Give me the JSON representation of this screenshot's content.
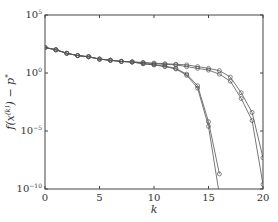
{
  "chart_data": {
    "type": "line",
    "title": "",
    "xlabel": "k",
    "ylabel": "f(x^(k)) − p*",
    "yscale": "log",
    "xlim": [
      0,
      20
    ],
    "ylim_log10": [
      -10,
      5
    ],
    "x_ticks": [
      0,
      5,
      10,
      15,
      20
    ],
    "x_tick_labels": [
      "0",
      "5",
      "10",
      "15",
      "20"
    ],
    "y_ticks_log10": [
      5,
      0,
      -5,
      -10
    ],
    "y_tick_labels": [
      "10^5",
      "10^0",
      "10^-5",
      "10^-10"
    ],
    "grid": false,
    "legend": null,
    "marker": "open circle",
    "line_color": "#555555",
    "series": [
      {
        "name": "series-1",
        "x": [
          0,
          1,
          2,
          3,
          4,
          5,
          6,
          7,
          8,
          9,
          10,
          11,
          12,
          13,
          14,
          15,
          16,
          17,
          18,
          19,
          20
        ],
        "log10_values": [
          2.2,
          2.0,
          1.7,
          1.5,
          1.4,
          1.2,
          1.1,
          1.0,
          0.95,
          0.9,
          0.85,
          0.8,
          0.75,
          0.7,
          0.55,
          0.4,
          0.2,
          -0.35,
          -1.7,
          -3.4,
          -7.3
        ]
      },
      {
        "name": "series-2",
        "x": [
          0,
          1,
          2,
          3,
          4,
          5,
          6,
          7,
          8,
          9,
          10,
          11,
          12,
          13,
          14,
          15,
          16,
          17,
          18,
          19,
          20
        ],
        "log10_values": [
          2.2,
          2.0,
          1.7,
          1.5,
          1.4,
          1.2,
          1.1,
          1.0,
          0.95,
          0.9,
          0.8,
          0.75,
          0.7,
          0.55,
          0.4,
          0.25,
          -0.1,
          -0.7,
          -2.2,
          -4.1,
          -9.6
        ]
      },
      {
        "name": "series-3",
        "x": [
          0,
          1,
          2,
          3,
          4,
          5,
          6,
          7,
          8,
          9,
          10,
          11,
          12,
          13,
          14,
          15,
          16
        ],
        "log10_values": [
          2.2,
          2.0,
          1.7,
          1.5,
          1.4,
          1.2,
          1.1,
          1.0,
          0.95,
          0.8,
          0.7,
          0.6,
          0.4,
          -0.1,
          -1.1,
          -4.2,
          -8.7
        ]
      },
      {
        "name": "series-4",
        "x": [
          0,
          1,
          2,
          3,
          4,
          5,
          6,
          7,
          8,
          9,
          10,
          11,
          12,
          13,
          14,
          15,
          16
        ],
        "log10_values": [
          2.2,
          2.0,
          1.7,
          1.5,
          1.4,
          1.2,
          1.1,
          1.0,
          0.95,
          0.8,
          0.7,
          0.55,
          0.35,
          -0.2,
          -1.3,
          -4.6,
          -10.5
        ]
      }
    ]
  }
}
